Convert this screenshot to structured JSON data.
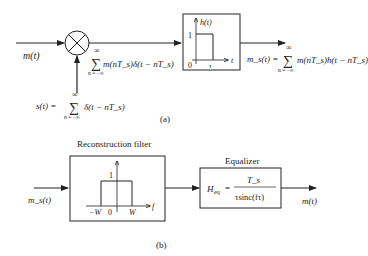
{
  "figure_a": {
    "caption": "(a)",
    "input_label": "m(t)",
    "multiplier": "multiplier",
    "sampled_signal": "m(nT_s)δ(t − nT_s)",
    "sampled_sum_upper": "∞",
    "sampled_sum_lower": "n = −∞",
    "sampling_signal_lhs": "s(t) =",
    "sampling_signal_rhs": "δ(t − nT_s)",
    "sampling_sum_upper": "∞",
    "sampling_sum_lower": "n = −∞",
    "hold_block": {
      "y_label": "h(t)",
      "x_label": "t",
      "one": "1",
      "zero": "0",
      "tau": "τ"
    },
    "output_lhs": "m_s(t) =",
    "output_rhs": "m(nT_s)h(t − nT_s)",
    "output_sum_upper": "∞",
    "output_sum_lower": "n = −∞"
  },
  "figure_b": {
    "caption": "(b)",
    "input_label": "m_s(t)",
    "filter_title": "Reconstruction filter",
    "filter_block": {
      "one": "1",
      "neg_w": "−W",
      "zero": "0",
      "w": "W",
      "x_label": "f"
    },
    "equalizer_title": "Equalizer",
    "equalizer_lhs": "H",
    "equalizer_sub": "eq",
    "equalizer_eq": "=",
    "equalizer_num": "T_s",
    "equalizer_den": "τsinc(fτ)",
    "output_label": "m(t)"
  }
}
